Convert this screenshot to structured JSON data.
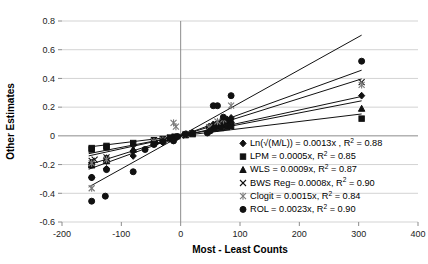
{
  "chart_data": {
    "type": "scatter",
    "title": "",
    "xlabel": "Most - Least Counts",
    "ylabel": "Other Estimates",
    "xlim": [
      -200,
      400
    ],
    "ylim": [
      -0.6,
      0.8
    ],
    "xticks": [
      -200,
      -100,
      0,
      100,
      200,
      300,
      400
    ],
    "xtick_labels": [
      "-200",
      "-100",
      "0",
      "100",
      "200",
      "300",
      "400"
    ],
    "yticks": [
      -0.6,
      -0.4,
      -0.2,
      0,
      0.2,
      0.4,
      0.6,
      0.8
    ],
    "ytick_labels": [
      "-0.6",
      "-0.4",
      "-0.2",
      "0",
      "0.2",
      "0.4",
      "0.6",
      "0.8"
    ],
    "grid": "horizontal",
    "legend_position": "inside-bottom-right",
    "series": [
      {
        "name": "Ln(√(M/L))",
        "marker": "diamond",
        "slope": 0.0013,
        "r2": 0.88,
        "legend_label": "Ln(√(M/L)) = 0.0013x , R",
        "legend_sup": "2",
        "legend_tail": " = 0.88",
        "points": [
          [
            -150,
            -0.2
          ],
          [
            -150,
            -0.185
          ],
          [
            -150,
            -0.29
          ],
          [
            -125,
            -0.175
          ],
          [
            -125,
            -0.155
          ],
          [
            -125,
            -0.23
          ],
          [
            -80,
            -0.14
          ],
          [
            -80,
            -0.105
          ],
          [
            -45,
            -0.055
          ],
          [
            -42,
            -0.05
          ],
          [
            -30,
            -0.045
          ],
          [
            -18,
            -0.02
          ],
          [
            -12,
            -0.012
          ],
          [
            -8,
            -0.008
          ],
          [
            5,
            0.006
          ],
          [
            10,
            0.012
          ],
          [
            20,
            0.022
          ],
          [
            48,
            0.065
          ],
          [
            55,
            0.08
          ],
          [
            62,
            0.09
          ],
          [
            70,
            0.105
          ],
          [
            78,
            0.115
          ],
          [
            85,
            0.125
          ],
          [
            305,
            0.28
          ]
        ]
      },
      {
        "name": "LPM",
        "marker": "square",
        "slope": 0.0005,
        "r2": 0.85,
        "legend_label": "LPM = 0.0005x, R",
        "legend_sup": "2",
        "legend_tail": " = 0.85",
        "points": [
          [
            -150,
            -0.095
          ],
          [
            -150,
            -0.085
          ],
          [
            -125,
            -0.08
          ],
          [
            -125,
            -0.07
          ],
          [
            -80,
            -0.05
          ],
          [
            -45,
            -0.03
          ],
          [
            -30,
            -0.022
          ],
          [
            -18,
            -0.012
          ],
          [
            -10,
            -0.006
          ],
          [
            8,
            0.005
          ],
          [
            20,
            0.012
          ],
          [
            48,
            0.04
          ],
          [
            58,
            0.05
          ],
          [
            68,
            0.055
          ],
          [
            78,
            0.062
          ],
          [
            85,
            0.07
          ],
          [
            305,
            0.12
          ]
        ]
      },
      {
        "name": "WLS",
        "marker": "triangle",
        "slope": 0.0009,
        "r2": 0.87,
        "legend_label": "WLS = 0.0009x, R",
        "legend_sup": "2",
        "legend_tail": " = 0.87",
        "points": [
          [
            -150,
            -0.205
          ],
          [
            -150,
            -0.195
          ],
          [
            -125,
            -0.175
          ],
          [
            -125,
            -0.165
          ],
          [
            -80,
            -0.095
          ],
          [
            -45,
            -0.045
          ],
          [
            -30,
            -0.03
          ],
          [
            -18,
            -0.018
          ],
          [
            -10,
            -0.01
          ],
          [
            8,
            0.008
          ],
          [
            20,
            0.02
          ],
          [
            48,
            0.055
          ],
          [
            58,
            0.075
          ],
          [
            68,
            0.085
          ],
          [
            78,
            0.1
          ],
          [
            85,
            0.11
          ],
          [
            305,
            0.19
          ]
        ]
      },
      {
        "name": "BWS Reg",
        "marker": "x",
        "slope": 0.0008,
        "r2": 0.9,
        "legend_label": "BWS Reg= 0.0008x, R",
        "legend_sup": "2",
        "legend_tail": " = 0.90",
        "points": [
          [
            -150,
            -0.175
          ],
          [
            -145,
            -0.165
          ],
          [
            -125,
            -0.15
          ],
          [
            -80,
            -0.085
          ],
          [
            -45,
            -0.04
          ],
          [
            -30,
            -0.025
          ],
          [
            -18,
            -0.015
          ],
          [
            -10,
            -0.008
          ],
          [
            8,
            0.008
          ],
          [
            20,
            0.018
          ],
          [
            48,
            0.05
          ],
          [
            58,
            0.07
          ],
          [
            68,
            0.082
          ],
          [
            78,
            0.095
          ],
          [
            85,
            0.1
          ],
          [
            305,
            0.375
          ]
        ]
      },
      {
        "name": "Clogit",
        "marker": "asterisk",
        "slope": 0.0015,
        "r2": 0.84,
        "legend_label": "Clogit = 0.0015x, R",
        "legend_sup": "2",
        "legend_tail": " = 0.84",
        "points": [
          [
            -150,
            -0.365
          ],
          [
            -150,
            -0.19
          ],
          [
            -125,
            -0.165
          ],
          [
            -45,
            -0.04
          ],
          [
            -30,
            -0.03
          ],
          [
            -12,
            0.09
          ],
          [
            -8,
            0.065
          ],
          [
            8,
            0.012
          ],
          [
            48,
            0.06
          ],
          [
            62,
            0.1
          ],
          [
            72,
            0.115
          ],
          [
            85,
            0.21
          ],
          [
            305,
            0.355
          ]
        ]
      },
      {
        "name": "ROL",
        "marker": "circle",
        "slope": 0.0023,
        "r2": 0.9,
        "legend_label": "ROL = 0.0023x, R",
        "legend_sup": "2",
        "legend_tail": " = 0.90",
        "points": [
          [
            -150,
            -0.455
          ],
          [
            -150,
            -0.29
          ],
          [
            -127,
            -0.42
          ],
          [
            -125,
            -0.235
          ],
          [
            -80,
            -0.25
          ],
          [
            -60,
            -0.095
          ],
          [
            -45,
            -0.06
          ],
          [
            -30,
            -0.04
          ],
          [
            -12,
            -0.035
          ],
          [
            -5,
            -0.005
          ],
          [
            8,
            0.012
          ],
          [
            45,
            0.02
          ],
          [
            50,
            0.035
          ],
          [
            55,
            0.21
          ],
          [
            62,
            0.21
          ],
          [
            72,
            0.13
          ],
          [
            85,
            0.28
          ],
          [
            305,
            0.52
          ]
        ]
      }
    ]
  }
}
